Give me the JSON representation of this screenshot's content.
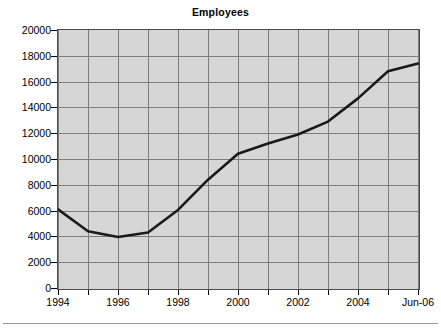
{
  "chart_data": {
    "type": "line",
    "title": "Employees",
    "xlabel": "",
    "ylabel": "",
    "categories": [
      "1994",
      "1995",
      "1996",
      "1997",
      "1998",
      "1999",
      "2000",
      "2001",
      "2002",
      "2003",
      "2004",
      "2005",
      "Jun-06"
    ],
    "x_tick_labels": [
      "1994",
      "",
      "1996",
      "",
      "1998",
      "",
      "2000",
      "",
      "2002",
      "",
      "2004",
      "",
      "Jun-06"
    ],
    "values": [
      6100,
      4400,
      3950,
      4300,
      6050,
      8400,
      10400,
      11200,
      11900,
      12900,
      14700,
      16800,
      17400
    ],
    "series": [
      {
        "name": "Employees",
        "values": [
          6100,
          4400,
          3950,
          4300,
          6050,
          8400,
          10400,
          11200,
          11900,
          12900,
          14700,
          16800,
          17400
        ]
      }
    ],
    "ylim": [
      0,
      20000
    ],
    "y_tick_labels": [
      "0",
      "2000",
      "4000",
      "6000",
      "8000",
      "10000",
      "12000",
      "14000",
      "16000",
      "18000",
      "20000"
    ],
    "y_tick_values": [
      0,
      2000,
      4000,
      6000,
      8000,
      10000,
      12000,
      14000,
      16000,
      18000,
      20000
    ],
    "grid": true,
    "legend": "none",
    "colors": {
      "line": "#1a1a1a",
      "plot_background": "#d6d6d6",
      "gridline": "#7d7d7d",
      "frame": "#4a4a4a",
      "text": "#000000",
      "figure_background": "#ffffff",
      "rule": "#9a9a9a"
    },
    "line_width": 2.6,
    "markers": "none"
  }
}
